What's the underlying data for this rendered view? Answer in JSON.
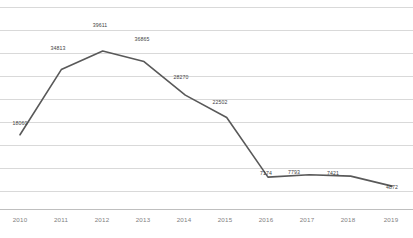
{
  "chart_data": {
    "type": "line",
    "title": "",
    "subtitle": "",
    "xlabel": "",
    "ylabel": "",
    "categories": [
      "2010",
      "2011",
      "2012",
      "2013",
      "2014",
      "2015",
      "2016",
      "2017",
      "2018",
      "2019"
    ],
    "values": [
      18060,
      34813,
      39611,
      36865,
      28270,
      22502,
      7174,
      7793,
      7421,
      4872
    ],
    "data_labels": [
      "18060",
      "34813",
      "39611",
      "36865",
      "28270",
      "22502",
      "7174",
      "7793",
      "7421",
      "4872"
    ],
    "series": [
      {
        "name": "",
        "values": [
          18060,
          34813,
          39611,
          36865,
          28270,
          22502,
          7174,
          7793,
          7421,
          4872
        ],
        "color": "#595959"
      }
    ],
    "ylim": [
      0,
      45000
    ],
    "gridlines": {
      "horizontal": true,
      "vertical": false,
      "count": 9,
      "color": "#d9d9d9"
    },
    "axis": {
      "x_axis_line_color": "#bfbfbf",
      "tick_label_color": "#808080"
    },
    "legend": {
      "visible": false,
      "position": "none"
    },
    "markers": false,
    "line_color": "#595959",
    "line_width": 1.6,
    "data_label_color": "#3f3f3f",
    "background": "#ffffff"
  }
}
